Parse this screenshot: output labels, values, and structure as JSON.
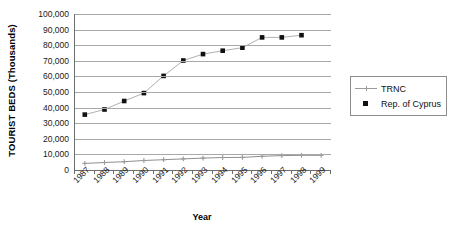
{
  "chart_data": {
    "type": "line",
    "title": "",
    "xlabel": "Year",
    "ylabel": "TOURIST BEDS (Thousands)",
    "categories": [
      "1987",
      "1988",
      "1989",
      "1990",
      "1991",
      "1992",
      "1993",
      "1994",
      "1995",
      "1996",
      "1997",
      "1998",
      "1999"
    ],
    "ylim": [
      0,
      100000
    ],
    "ytick_labels": [
      "0",
      "10,000",
      "20,000",
      "30,000",
      "40,000",
      "50,000",
      "60,000",
      "70,000",
      "80,000",
      "90,000",
      "100,000"
    ],
    "ytick_values": [
      0,
      10000,
      20000,
      30000,
      40000,
      50000,
      60000,
      70000,
      80000,
      90000,
      100000
    ],
    "grid": "horizontal",
    "legend_position": "right",
    "series": [
      {
        "name": "TRNC",
        "color": "#9a9a9a",
        "marker": "cross",
        "values": [
          4200,
          4800,
          5300,
          6100,
          6600,
          7100,
          7600,
          8000,
          8100,
          8800,
          9200,
          9400,
          9400
        ]
      },
      {
        "name": "Rep. of Cyprus",
        "color": "#111111",
        "marker": "square",
        "values": [
          35500,
          38800,
          44200,
          49300,
          60300,
          70200,
          74300,
          76500,
          78400,
          85000,
          85000,
          86400,
          null
        ]
      }
    ]
  },
  "legend": {
    "items": [
      {
        "label": "TRNC"
      },
      {
        "label": "Rep. of Cyprus"
      }
    ]
  },
  "axes": {
    "y_title": "TOURIST BEDS (Thousands)",
    "x_title": "Year"
  }
}
